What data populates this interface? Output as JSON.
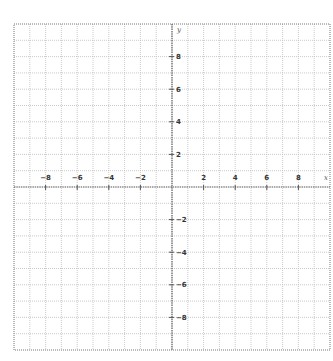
{
  "chart_data": {
    "type": "scatter",
    "title": "",
    "xlabel": "x",
    "ylabel": "y",
    "xlim": [
      -10,
      10
    ],
    "ylim": [
      -10,
      10
    ],
    "grid": true,
    "grid_step": 1,
    "x_ticks": [
      -8,
      -6,
      -4,
      -2,
      2,
      4,
      6,
      8
    ],
    "y_ticks": [
      8,
      6,
      4,
      2,
      -2,
      -4,
      -6,
      -8
    ],
    "series": []
  },
  "layout": {
    "plot_left": 14,
    "plot_right": 330,
    "plot_top": 24,
    "plot_bottom": 350,
    "origin_x": 172,
    "origin_y": 187
  },
  "colors": {
    "grid": "#bdbdbd",
    "axis": "#555555",
    "border": "#777777",
    "label": "#333333"
  }
}
